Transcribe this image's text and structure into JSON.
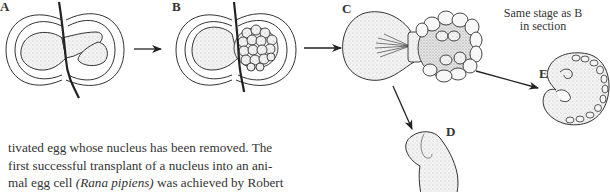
{
  "figure": {
    "panels": [
      {
        "id": "A",
        "label": "A"
      },
      {
        "id": "B",
        "label": "B"
      },
      {
        "id": "C",
        "label": "C",
        "note_line1": "Same stage as B",
        "note_line2": "in section"
      },
      {
        "id": "D",
        "label": "D"
      },
      {
        "id": "E",
        "label": "E"
      }
    ],
    "arrows": [
      {
        "from": "A",
        "to": "B"
      },
      {
        "from": "B",
        "to": "C"
      },
      {
        "from": "C",
        "to": "D"
      },
      {
        "from": "C",
        "to": "E"
      }
    ]
  },
  "text": {
    "line1": "tivated egg whose nucleus has been removed. The",
    "line2": "first successful transplant of a nucleus into an ani-",
    "line3_pre": "mal egg cell ",
    "line3_italic": "(Rana pipiens)",
    "line3_post": " was achieved by Robert"
  }
}
